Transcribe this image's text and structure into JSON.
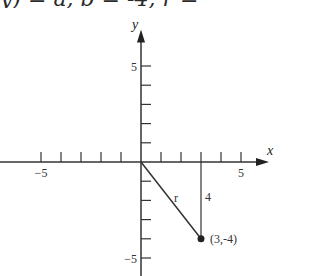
{
  "top_text_fragment": "y) = a, b = -4, r = ",
  "diagram": {
    "x_axis_label": "x",
    "y_axis_label": "y",
    "x_ticks": [
      -5,
      -4,
      -3,
      -2,
      -1,
      1,
      2,
      3,
      4,
      5
    ],
    "y_ticks": [
      -5,
      -4,
      -3,
      -2,
      -1,
      1,
      2,
      3,
      4,
      5
    ],
    "x_tick_labels": [
      {
        "value": -5,
        "text": "−5"
      },
      {
        "value": 5,
        "text": "5"
      }
    ],
    "y_tick_labels": [
      {
        "value": 5,
        "text": "5"
      },
      {
        "value": -5,
        "text": "−5"
      }
    ],
    "point": {
      "x": 3,
      "y": -4,
      "label": "(3,-4)"
    },
    "segment_r_label": "r",
    "vertical_leg_label": "4"
  }
}
